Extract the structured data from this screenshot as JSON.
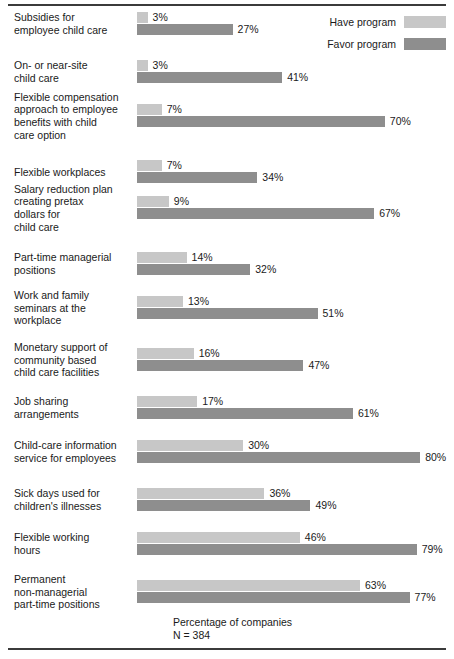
{
  "legend": {
    "items": [
      {
        "label": "Have program",
        "color": "#c7c7c7",
        "key": "have"
      },
      {
        "label": "Favor program",
        "color": "#8e8e8e",
        "key": "favor"
      }
    ]
  },
  "caption": {
    "line1": "Percentage of companies",
    "line2": "N = 384"
  },
  "chart_data": {
    "type": "bar",
    "orientation": "horizontal",
    "title": "",
    "subtitle": "",
    "xlabel": "Percentage of companies",
    "ylabel": "",
    "xlim": [
      0,
      80
    ],
    "grid": false,
    "legend_position": "top-right",
    "annotations": [
      "Percentage of companies",
      "N = 384"
    ],
    "value_suffix": "%",
    "categories": [
      "Subsidies for employee child care",
      "On- or near-site child care",
      "Flexible compensation approach to employee benefits with child care option",
      "Flexible workplaces",
      "Salary reduction plan creating pretax dollars for child care",
      "Part-time managerial positions",
      "Work and family seminars at the workplace",
      "Monetary support of community based child care facilities",
      "Job sharing arrangements",
      "Child-care information service for employees",
      "Sick days used for children's illnesses",
      "Flexible working hours",
      "Permanent non-managerial part-time positions"
    ],
    "category_lines": [
      [
        "Subsidies for",
        "employee child care"
      ],
      [
        "On- or near-site",
        "child care"
      ],
      [
        "Flexible compensation",
        "approach to employee",
        "benefits with child",
        "care option"
      ],
      [
        "Flexible workplaces"
      ],
      [
        "Salary reduction plan",
        "creating pretax",
        "dollars for",
        "child care"
      ],
      [
        "Part-time managerial",
        "positions"
      ],
      [
        "Work and family",
        "seminars at the",
        "workplace"
      ],
      [
        "Monetary support of",
        "community based",
        "child care facilities"
      ],
      [
        "Job sharing",
        "arrangements"
      ],
      [
        "Child-care information",
        "service for employees"
      ],
      [
        "Sick days used for",
        "children's illnesses"
      ],
      [
        "Flexible working",
        "hours"
      ],
      [
        "Permanent",
        "non-managerial",
        "part-time positions"
      ]
    ],
    "series": [
      {
        "name": "Have program",
        "color": "#c7c7c7",
        "values": [
          3,
          3,
          7,
          7,
          9,
          14,
          13,
          16,
          17,
          30,
          36,
          46,
          63
        ],
        "labels": [
          "3%",
          "3%",
          "7%",
          "7%",
          "9%",
          "14%",
          "13%",
          "16%",
          "17%",
          "30%",
          "36%",
          "46%",
          "63%"
        ]
      },
      {
        "name": "Favor program",
        "color": "#8e8e8e",
        "values": [
          27,
          41,
          70,
          34,
          67,
          32,
          51,
          47,
          61,
          80,
          49,
          79,
          77
        ],
        "labels": [
          "27%",
          "41%",
          "70%",
          "34%",
          "67%",
          "32%",
          "51%",
          "47%",
          "61%",
          "80%",
          "49%",
          "79%",
          "77%"
        ]
      }
    ]
  },
  "layout": {
    "row_tops": [
      12,
      60,
      104,
      160,
      196,
      252,
      296,
      348,
      396,
      440,
      488,
      532,
      580
    ],
    "bar_px_per_percent": 3.54
  }
}
